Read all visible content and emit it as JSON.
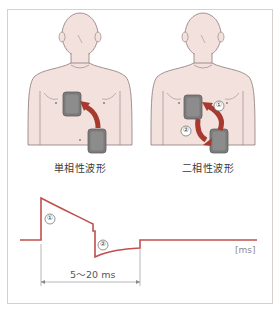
{
  "figure": {
    "panels": [
      {
        "id": "monophasic",
        "label": "単相性波形",
        "arrow_markers": []
      },
      {
        "id": "biphasic",
        "label": "二相性波形",
        "arrow_markers": [
          "①",
          "②"
        ]
      }
    ],
    "waveform": {
      "phase_markers": [
        "①",
        "②"
      ],
      "unit_label": "[ms]",
      "duration_label": "5〜20 ms"
    },
    "colors": {
      "border": "#d9cfcc",
      "skin": "#f3e1dd",
      "outline": "#8a7a78",
      "pad": "#7b7b7b",
      "arrow": "#a8392f",
      "waveform": "#c0504d"
    }
  }
}
